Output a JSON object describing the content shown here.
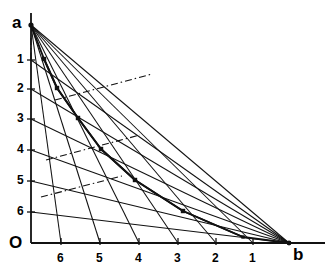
{
  "figure": {
    "kind": "line-diagram",
    "background_color": "#ffffff",
    "stroke_color": "#000000",
    "vertex_labels": {
      "apex": "a",
      "origin": "O",
      "right": "b"
    },
    "left_axis": {
      "name": "vertical-scale",
      "ticks": [
        "1",
        "2",
        "3",
        "4",
        "5",
        "6"
      ],
      "tick_y": [
        60,
        89,
        119,
        150,
        181,
        212
      ],
      "label_x": 17,
      "axis_x": 31,
      "top_y": 25,
      "bottom_y": 243
    },
    "bottom_axis": {
      "name": "horizontal-scale",
      "ticks": [
        "6",
        "5",
        "4",
        "3",
        "2",
        "1"
      ],
      "tick_x": [
        61,
        100,
        139,
        178,
        216,
        253
      ],
      "label_y": 252,
      "axis_y": 243,
      "left_x": 31,
      "right_x": 289,
      "overrun_x": 325
    },
    "points": {
      "a": [
        31,
        25
      ],
      "b": [
        289,
        243
      ],
      "O": [
        31,
        243
      ]
    },
    "fan_from_a_targets_x": [
      61,
      100,
      139,
      178,
      216,
      253,
      289
    ],
    "fan_from_b_targets_y": [
      60,
      89,
      119,
      150,
      181,
      212,
      243
    ],
    "zigzag_vertices": [
      [
        31,
        25
      ],
      [
        44,
        59
      ],
      [
        57,
        88
      ],
      [
        78,
        118
      ],
      [
        101,
        149
      ],
      [
        135,
        180
      ],
      [
        183,
        211
      ],
      [
        243,
        237
      ],
      [
        289,
        243
      ]
    ],
    "dashdot_segments": [
      {
        "from": [
          31,
          38
        ],
        "to": [
          31,
          60
        ]
      },
      {
        "from": [
          55,
          100
        ],
        "to": [
          152,
          74
        ]
      },
      {
        "from": [
          46,
          160
        ],
        "to": [
          140,
          135
        ]
      },
      {
        "from": [
          41,
          197
        ],
        "to": [
          122,
          176
        ]
      },
      {
        "from": [
          118,
          243
        ],
        "to": [
          160,
          243
        ]
      },
      {
        "from": [
          198,
          243
        ],
        "to": [
          226,
          243
        ]
      }
    ],
    "colors": {
      "ink": "#111111",
      "paper": "#ffffff"
    }
  }
}
